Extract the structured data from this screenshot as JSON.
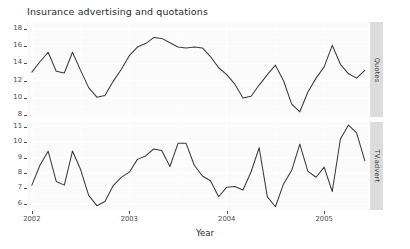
{
  "chart_data": {
    "type": "line",
    "title": "Insurance advertising and quotations",
    "xlabel": "Year",
    "ylabel": "",
    "grid": true,
    "legend_position": "right-strip",
    "facet_labels": [
      "Quotes",
      "TV.advert"
    ],
    "x_tick_labels": [
      "2002",
      "2003",
      "2004",
      "2005"
    ],
    "x_tick_values": [
      2002,
      2003,
      2004,
      2005
    ],
    "xlim": [
      2001.95,
      2005.45
    ],
    "line_color": "#3a3a3a",
    "panel_background": "#fbfbfb",
    "strip_background": "#dcdcdc",
    "panels": [
      {
        "name": "Quotes",
        "ylabel": "Quotes",
        "y_tick_labels": [
          "8",
          "10",
          "12",
          "14",
          "16",
          "18"
        ],
        "y_tick_values": [
          8,
          10,
          12,
          14,
          16,
          18
        ],
        "ylim": [
          7.8,
          18.8
        ],
        "x": [
          2002.0,
          2002.083,
          2002.167,
          2002.25,
          2002.333,
          2002.417,
          2002.5,
          2002.583,
          2002.667,
          2002.75,
          2002.833,
          2002.917,
          2003.0,
          2003.083,
          2003.167,
          2003.25,
          2003.333,
          2003.417,
          2003.5,
          2003.583,
          2003.667,
          2003.75,
          2003.833,
          2003.917,
          2004.0,
          2004.083,
          2004.167,
          2004.25,
          2004.333,
          2004.417,
          2004.5,
          2004.583,
          2004.667,
          2004.75,
          2004.833,
          2004.917,
          2005.0,
          2005.083,
          2005.167,
          2005.25,
          2005.333,
          2005.417
        ],
        "values": [
          13.0,
          14.2,
          15.3,
          13.1,
          12.9,
          15.3,
          13.2,
          11.2,
          10.1,
          10.3,
          11.9,
          13.3,
          14.9,
          15.9,
          16.3,
          17.0,
          16.9,
          16.4,
          15.9,
          15.8,
          15.9,
          15.8,
          14.8,
          13.5,
          12.7,
          11.6,
          10.0,
          10.2,
          11.5,
          12.7,
          13.8,
          12.0,
          9.3,
          8.4,
          10.7,
          12.3,
          13.6,
          16.1,
          13.9,
          12.8,
          12.3,
          13.2
        ]
      },
      {
        "name": "TV.advert",
        "ylabel": "TV.advert",
        "y_tick_labels": [
          "6",
          "7",
          "8",
          "9",
          "10",
          "11"
        ],
        "y_tick_values": [
          6,
          7,
          8,
          9,
          10,
          11
        ],
        "ylim": [
          5.6,
          11.3
        ],
        "x": [
          2002.0,
          2002.083,
          2002.167,
          2002.25,
          2002.333,
          2002.417,
          2002.5,
          2002.583,
          2002.667,
          2002.75,
          2002.833,
          2002.917,
          2003.0,
          2003.083,
          2003.167,
          2003.25,
          2003.333,
          2003.417,
          2003.5,
          2003.583,
          2003.667,
          2003.75,
          2003.833,
          2003.917,
          2004.0,
          2004.083,
          2004.167,
          2004.25,
          2004.333,
          2004.417,
          2004.5,
          2004.583,
          2004.667,
          2004.75,
          2004.833,
          2004.917,
          2005.0,
          2005.083,
          2005.167,
          2005.25,
          2005.333,
          2005.417
        ],
        "values": [
          7.21,
          8.5,
          9.41,
          7.45,
          7.21,
          9.42,
          8.22,
          6.55,
          5.88,
          6.15,
          7.16,
          7.71,
          8.05,
          8.88,
          9.1,
          9.55,
          9.45,
          8.42,
          9.92,
          9.92,
          8.5,
          7.8,
          7.5,
          6.46,
          7.08,
          7.12,
          6.9,
          8.08,
          9.63,
          6.45,
          5.81,
          7.29,
          8.17,
          9.87,
          8.1,
          7.72,
          8.38,
          6.8,
          10.2,
          11.1,
          10.6,
          8.8
        ]
      }
    ]
  },
  "extra_values": {
    "quotes_tail": [
      18.6,
      17.9,
      14.8
    ],
    "tv_tail": [
      11.1,
      10.6,
      8.8
    ]
  }
}
